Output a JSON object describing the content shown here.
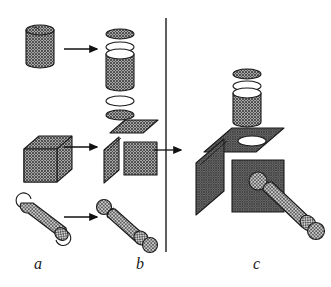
{
  "figure": {
    "background_color": "#ffffff",
    "ink_color": "#1a1a1a",
    "hatch_color": "#4a4a4a",
    "width": 331,
    "height": 287
  },
  "panels": [
    {
      "id": "a",
      "label": "a",
      "caption_x": 34,
      "caption_y": 255,
      "description": "solid primitives"
    },
    {
      "id": "b",
      "label": "b",
      "caption_x": 136,
      "caption_y": 255,
      "description": "exploded primitives"
    },
    {
      "id": "c",
      "label": "c",
      "caption_x": 253,
      "caption_y": 255,
      "description": "assembled composite"
    }
  ],
  "divider": {
    "name": "vertical-divider",
    "x": 166,
    "y_top": 18,
    "y_bottom": 252
  },
  "arrows": [
    {
      "name": "arrow-cylinder",
      "x1": 64,
      "y1": 49,
      "x2": 98,
      "y2": 49
    },
    {
      "name": "arrow-cube",
      "x1": 64,
      "y1": 147,
      "x2": 98,
      "y2": 147
    },
    {
      "name": "arrow-rod",
      "x1": 64,
      "y1": 217,
      "x2": 98,
      "y2": 217
    },
    {
      "name": "arrow-assemble",
      "x1": 152,
      "y1": 150,
      "x2": 182,
      "y2": 150
    }
  ],
  "shapes": {
    "cylinder_solid": {
      "name": "solid-cylinder",
      "cx": 40,
      "top_y": 30,
      "rx": 14,
      "ry": 5,
      "body_height": 33,
      "fill": "hatch"
    },
    "cylinder_exploded": {
      "name": "exploded-cylinder",
      "cx": 120,
      "parts": [
        {
          "name": "cylinder-top-disc",
          "type": "ellipse",
          "cy": 34,
          "rx": 14,
          "ry": 5,
          "fill": "hatch"
        },
        {
          "name": "cylinder-top-ring",
          "type": "ellipse",
          "cy": 47,
          "rx": 14,
          "ry": 5,
          "fill": "none"
        },
        {
          "name": "cylinder-body",
          "type": "tube",
          "top_y": 54,
          "rx": 14,
          "ry": 5,
          "body_height": 32,
          "fill": "hatch"
        },
        {
          "name": "cylinder-bottom-ring",
          "type": "ellipse",
          "cy": 101,
          "rx": 14,
          "ry": 5,
          "fill": "none"
        },
        {
          "name": "cylinder-bottom-disc",
          "type": "ellipse",
          "cy": 115,
          "rx": 14,
          "ry": 5,
          "fill": "hatch"
        }
      ]
    },
    "cube_solid": {
      "name": "solid-cube",
      "front_x": 24,
      "front_y": 136,
      "size": 33,
      "depth_x": 15,
      "depth_y": -13,
      "fill": "hatch"
    },
    "cube_exploded": {
      "name": "exploded-cube",
      "front_x": 110,
      "front_y": 142,
      "size": 32,
      "depth_x": 15,
      "depth_y": -13,
      "parts": [
        "cube-top-face",
        "cube-left-face",
        "cube-front-face"
      ]
    },
    "rod_solid": {
      "name": "solid-rod",
      "x1": 25,
      "y1": 208,
      "x2": 58,
      "y2": 233,
      "radius": 7,
      "fill": "hatch"
    },
    "rod_exploded": {
      "name": "exploded-rod",
      "x1": 103,
      "y1": 205,
      "x2": 150,
      "y2": 246,
      "radius": 7,
      "parts": [
        "rod-end-ball",
        "rod-shaft",
        "rod-cap-near",
        "rod-cap-far"
      ]
    },
    "assembly": {
      "name": "assembled-composite",
      "cube": {
        "front_x": 232,
        "front_y": 160,
        "size": 52,
        "depth_x": 28,
        "depth_y": -24
      },
      "cylinder": {
        "cx": 247,
        "top_y": 90,
        "rx": 15,
        "ry": 5,
        "body_height": 30
      },
      "rod": {
        "x1": 262,
        "y1": 182,
        "x2": 312,
        "y2": 228,
        "radius": 8
      },
      "socket_ellipse": {
        "cx": 252,
        "cy": 135,
        "rx": 14,
        "ry": 5
      }
    }
  }
}
